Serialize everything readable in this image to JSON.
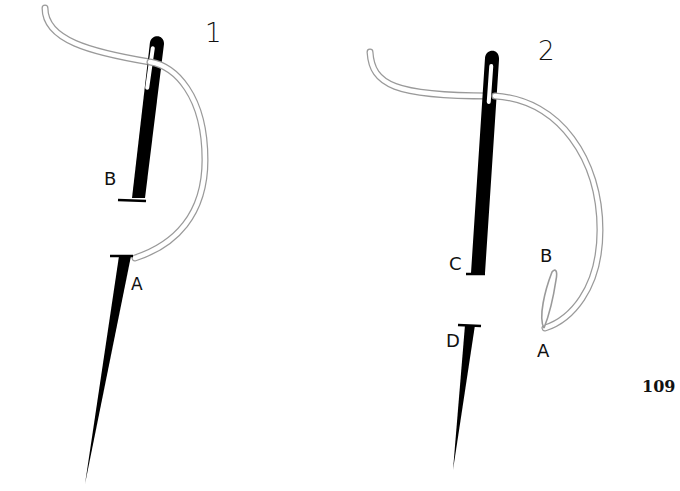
{
  "figures": [
    {
      "number": "1",
      "labels": {
        "upper": "B",
        "lower": "A"
      }
    },
    {
      "number": "2",
      "labels": {
        "upper": "C",
        "lower": "D",
        "loop_top": "B",
        "loop_bottom": "A"
      }
    }
  ],
  "page_number": "109",
  "colors": {
    "needle": "#000000",
    "thread_outline": "#9a9a9a",
    "thread_fill": "#ffffff",
    "background": "#ffffff"
  }
}
